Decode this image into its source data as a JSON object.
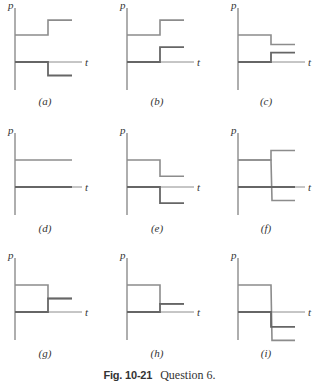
{
  "figure": {
    "caption_number": "Fig. 10-21",
    "caption_text": "Question 6.",
    "axis_labels": {
      "y": "p",
      "x": "t"
    },
    "line_color": "#8c8c8c",
    "axis_color": "#8c8c8c",
    "overlap_color": "#666666"
  },
  "chart_data": {
    "type": "line",
    "title": "Fig. 10-21 Question 6.",
    "xlabel": "t",
    "ylabel": "p",
    "units_note": "values in relative units; initial upper line = 1, t-axis = 0; change occurs at t = 1, ends at t = 1.75",
    "panels": [
      {
        "label": "(a)",
        "lines": [
          {
            "before": 1.0,
            "after": 1.55
          },
          {
            "before": 0.0,
            "after": -0.5
          }
        ]
      },
      {
        "label": "(b)",
        "lines": [
          {
            "before": 1.0,
            "after": 1.55
          },
          {
            "before": 0.0,
            "after": 0.55
          }
        ]
      },
      {
        "label": "(c)",
        "lines": [
          {
            "before": 1.0,
            "after": 0.65
          },
          {
            "before": 0.0,
            "after": 0.35
          }
        ]
      },
      {
        "label": "(d)",
        "lines": [
          {
            "before": 1.0,
            "after": 1.0
          },
          {
            "before": 0.0,
            "after": 0.0
          }
        ]
      },
      {
        "label": "(e)",
        "lines": [
          {
            "before": 1.0,
            "after": 0.4
          },
          {
            "before": 0.0,
            "after": -0.6
          }
        ]
      },
      {
        "label": "(f)",
        "lines": [
          {
            "before": 1.0,
            "after": 1.35
          },
          {
            "before": 1.0,
            "after": -0.5
          },
          {
            "before": 0.0,
            "after": 0.0
          }
        ]
      },
      {
        "label": "(g)",
        "lines": [
          {
            "before": 1.0,
            "after": 0.5
          },
          {
            "before": 0.0,
            "after": 0.5
          }
        ]
      },
      {
        "label": "(h)",
        "lines": [
          {
            "before": 1.0,
            "after": 0.3
          },
          {
            "before": 0.0,
            "after": 0.3
          }
        ]
      },
      {
        "label": "(i)",
        "lines": [
          {
            "before": 1.0,
            "after": -1.05
          },
          {
            "before": 0.0,
            "after": -0.55
          }
        ]
      }
    ]
  },
  "layout": {
    "unit_px": 27,
    "step_px": 33,
    "end_px": 57,
    "axis_right_px": 67,
    "axis_top_px": 54,
    "axis_bottom_px": 28,
    "columns_x": [
      15,
      127,
      238
    ],
    "rows_y": [
      62,
      187,
      312
    ],
    "panel_labels": [
      {
        "text": "(a)",
        "x": 45,
        "y": 105
      },
      {
        "text": "(b)",
        "x": 157,
        "y": 105
      },
      {
        "text": "(c)",
        "x": 266,
        "y": 105
      },
      {
        "text": "(d)",
        "x": 45,
        "y": 232
      },
      {
        "text": "(e)",
        "x": 157,
        "y": 232
      },
      {
        "text": "(f)",
        "x": 266,
        "y": 232
      },
      {
        "text": "(g)",
        "x": 45,
        "y": 357
      },
      {
        "text": "(h)",
        "x": 157,
        "y": 357
      },
      {
        "text": "(i)",
        "x": 266,
        "y": 357
      }
    ]
  }
}
